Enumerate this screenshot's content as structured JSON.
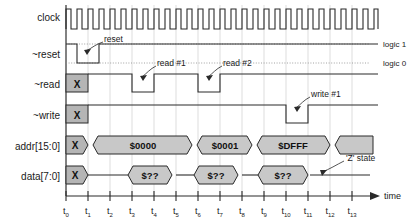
{
  "diagram": {
    "time_axis_label": "time",
    "z_state_label": "'Z' state",
    "logic_high_label": "logic 1",
    "logic_low_label": "logic 0",
    "signals": [
      {
        "name": "clock",
        "label": "clock"
      },
      {
        "name": "reset",
        "label": "~reset"
      },
      {
        "name": "read",
        "label": "~read"
      },
      {
        "name": "write",
        "label": "~write"
      },
      {
        "name": "addr",
        "label": "addr[15:0]"
      },
      {
        "name": "data",
        "label": "data[7:0]"
      }
    ],
    "annotations": [
      {
        "name": "reset-annotation",
        "label": "reset"
      },
      {
        "name": "read1-annotation",
        "label": "read #1"
      },
      {
        "name": "read2-annotation",
        "label": "read #2"
      },
      {
        "name": "write1-annotation",
        "label": "write #1"
      }
    ],
    "time_ticks": [
      {
        "base": "t",
        "sub": "0"
      },
      {
        "base": "t",
        "sub": "1"
      },
      {
        "base": "t",
        "sub": "2"
      },
      {
        "base": "t",
        "sub": "3"
      },
      {
        "base": "t",
        "sub": "4"
      },
      {
        "base": "t",
        "sub": "5"
      },
      {
        "base": "t",
        "sub": "6"
      },
      {
        "base": "t",
        "sub": "7"
      },
      {
        "base": "t",
        "sub": "8"
      },
      {
        "base": "t",
        "sub": "9"
      },
      {
        "base": "t",
        "sub": "10"
      },
      {
        "base": "t",
        "sub": "11"
      },
      {
        "base": "t",
        "sub": "12"
      },
      {
        "base": "t",
        "sub": "13"
      }
    ],
    "unknown_marker": "X",
    "addr_values": [
      {
        "label": "$0000"
      },
      {
        "label": "$0001"
      },
      {
        "label": "$DFFF"
      }
    ],
    "data_values": [
      {
        "label": "$??"
      },
      {
        "label": "$??"
      },
      {
        "label": "$??"
      }
    ],
    "colors": {
      "bus_fill": "#c8c8c8",
      "unknown_fill": "#b5b5b5",
      "stroke": "#2a2a2a",
      "grid": "#cfcfcf"
    }
  }
}
